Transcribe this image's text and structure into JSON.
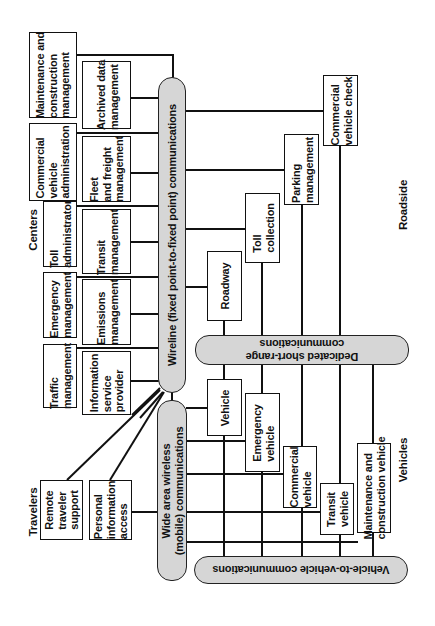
{
  "section_labels": {
    "centers": "Centers",
    "travelers": "Travelers",
    "roadside": "Roadside",
    "vehicles": "Vehicles"
  },
  "centers": {
    "outer": [
      {
        "label": "Maintenance and\nconstruction\nmanagement"
      },
      {
        "label": "Commercial\nvehicle\nadministration"
      },
      {
        "label": "Toll\nadministrator"
      },
      {
        "label": "Emergency\nmanagement"
      },
      {
        "label": "Traffic\nmanagement"
      }
    ],
    "inner": [
      {
        "label": "Archived data\nmanagement"
      },
      {
        "label": "Fleet\nand freight\nmanagement"
      },
      {
        "label": "Transit\nmanagement"
      },
      {
        "label": "Emissions\nmanagement"
      },
      {
        "label": "Information\nservice\nprovider"
      }
    ]
  },
  "travelers": [
    {
      "label": "Remote\ntraveler\nsupport"
    },
    {
      "label": "Personal\ninformation\naccess"
    }
  ],
  "roadside": [
    {
      "label": "Roadway"
    },
    {
      "label": "Toll\ncollection"
    },
    {
      "label": "Parking\nmanagement"
    },
    {
      "label": "Commercial\nvehicle check"
    }
  ],
  "vehicles": [
    {
      "label": "Vehicle"
    },
    {
      "label": "Emergency\nvehicle"
    },
    {
      "label": "Commercial\nvehicle"
    },
    {
      "label": "Transit\nvehicle"
    },
    {
      "label": "Maintenance and\nconstruction vehicle"
    }
  ],
  "communications": {
    "wireline": "Wireline (fixed point-to-fixed point) communications",
    "wide_area_wireless": "Wide area wireless\n(mobile) communications",
    "dsrc": "Dedicated short-range\ncommunications",
    "v2v": "Vehicle-to-vehicle communications"
  },
  "colors": {
    "bar_fill": "#d6d6d6",
    "line": "#111111",
    "box_fill": "#ffffff"
  }
}
